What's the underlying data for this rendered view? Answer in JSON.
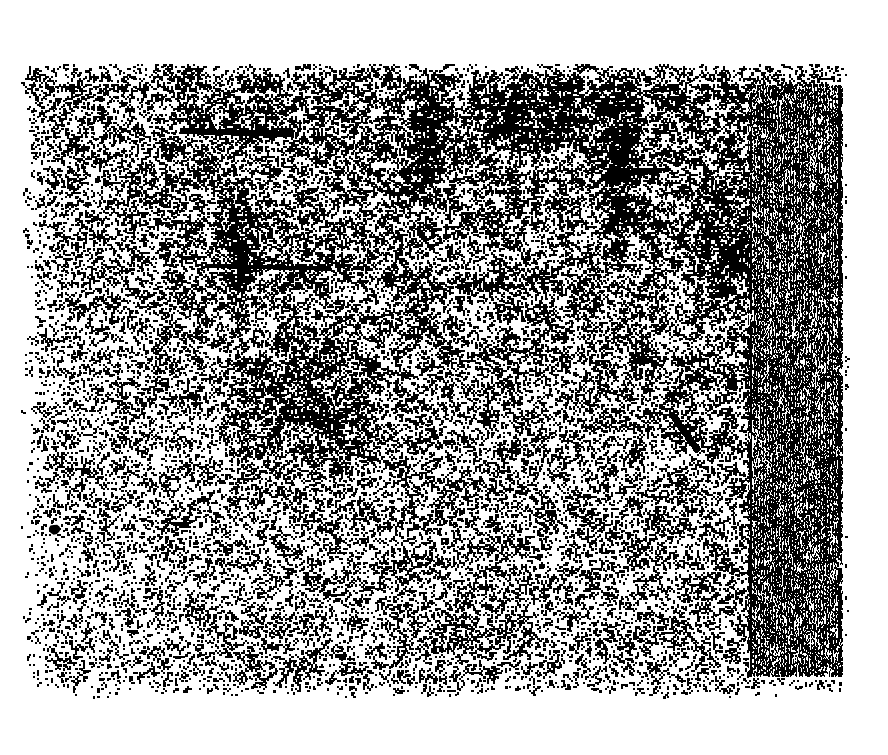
{
  "document": {
    "kind": "degraded-binarized-scan",
    "legible_text": "",
    "page_background_color": "#ffffff",
    "ink_color": "#000000",
    "canvas": {
      "width": 888,
      "height": 755
    }
  },
  "scan": {
    "main_field": {
      "name": "speckle-noise-field",
      "x": 28,
      "y": 63,
      "width": 815,
      "height": 629,
      "edge_jitter": 9
    },
    "spine_column": {
      "name": "scan-spine-stripe-column",
      "x": 748,
      "y": 85,
      "width": 95,
      "height": 591,
      "left_rule_x": 750,
      "right_rule_x": 839,
      "stripe_period": 3
    },
    "density_map": {
      "description": "relative ink coverage by region, 0..1",
      "top_band": 0.46,
      "upper_middle": 0.4,
      "middle_band": 0.3,
      "lower_middle": 0.2,
      "bottom_band": 0.14,
      "left_margin_col": 0.16,
      "center_col": 0.34,
      "right_col": 0.38,
      "spine_col": 0.62
    },
    "artifacts": [
      {
        "name": "horizontal-ink-streak",
        "type": "streak",
        "x1": 180,
        "y1": 130,
        "x2": 292,
        "y2": 133,
        "thickness": 4
      },
      {
        "name": "horizontal-ink-streak-secondary",
        "type": "streak",
        "x1": 205,
        "y1": 265,
        "x2": 330,
        "y2": 268,
        "thickness": 3
      },
      {
        "name": "dark-vertical-cluster-left",
        "type": "cluster",
        "x": 215,
        "y": 185,
        "width": 40,
        "height": 120,
        "density": 0.55
      },
      {
        "name": "dark-vertical-cluster-center",
        "type": "cluster",
        "x": 408,
        "y": 70,
        "width": 34,
        "height": 130,
        "density": 0.58
      },
      {
        "name": "dark-vertical-cluster-right",
        "type": "cluster",
        "x": 598,
        "y": 68,
        "width": 38,
        "height": 175,
        "density": 0.62
      },
      {
        "name": "dark-band-upper-right",
        "type": "cluster",
        "x": 470,
        "y": 75,
        "width": 120,
        "height": 70,
        "density": 0.5
      },
      {
        "name": "dark-cluster-midcenter",
        "type": "cluster",
        "x": 240,
        "y": 330,
        "width": 130,
        "height": 150,
        "density": 0.44
      },
      {
        "name": "diagonal-ink-streak",
        "type": "diagonal",
        "x1": 671,
        "y1": 413,
        "x2": 697,
        "y2": 450,
        "thickness": 5
      },
      {
        "name": "solid-ink-blob",
        "type": "blob",
        "x": 48,
        "y": 524,
        "width": 13,
        "height": 11
      },
      {
        "name": "dark-cluster-bottom-left",
        "type": "cluster",
        "x": 52,
        "y": 628,
        "width": 38,
        "height": 62,
        "density": 0.42
      },
      {
        "name": "dark-cluster-bottom-center",
        "type": "cluster",
        "x": 390,
        "y": 600,
        "width": 150,
        "height": 55,
        "density": 0.3
      },
      {
        "name": "dark-cluster-midright",
        "type": "cluster",
        "x": 690,
        "y": 180,
        "width": 55,
        "height": 130,
        "density": 0.5
      }
    ]
  }
}
